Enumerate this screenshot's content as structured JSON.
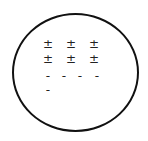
{
  "diagram": {
    "shape": "circle",
    "stroke_color": "#111111",
    "rows": [
      {
        "symbols": [
          "±",
          "±",
          "±"
        ],
        "x": [
          43,
          66,
          89
        ],
        "y": 38
      },
      {
        "symbols": [
          "±",
          "±",
          "±"
        ],
        "x": [
          43,
          66,
          89
        ],
        "y": 53
      },
      {
        "symbols": [
          "-",
          "-",
          "-",
          "-"
        ],
        "x": [
          43,
          59,
          75,
          92
        ],
        "y": 70
      },
      {
        "symbols": [
          "-"
        ],
        "x": [
          43
        ],
        "y": 84
      }
    ]
  }
}
